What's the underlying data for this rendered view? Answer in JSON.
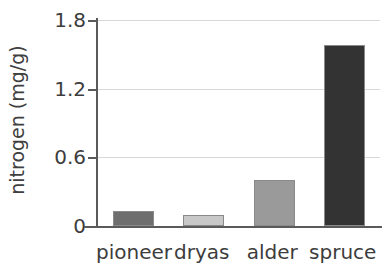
{
  "chart_data": {
    "type": "bar",
    "title": "",
    "xlabel": "",
    "ylabel": "nitrogen (mg/g)",
    "categories": [
      "pioneer",
      "dryas",
      "alder",
      "spruce"
    ],
    "values": [
      0.13,
      0.1,
      0.4,
      1.58
    ],
    "bar_colors": [
      "#6e6e6e",
      "#c8c8c8",
      "#9a9a9a",
      "#333333"
    ],
    "ylim": [
      0,
      1.8
    ],
    "yticks": [
      0,
      0.6,
      1.2,
      1.8
    ],
    "ytick_labels": [
      "0",
      "0.6",
      "1.2",
      "1.8"
    ],
    "grid": true,
    "grid_axis": "y",
    "grid_color": "#d8d8d8",
    "legend": "none",
    "axis_color": "#5a5a5a",
    "background_color": "#ffffff",
    "bar_edge_color": "#8a8a8a"
  }
}
